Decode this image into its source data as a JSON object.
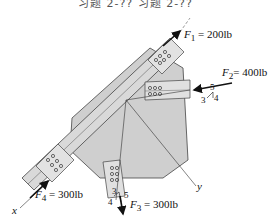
{
  "header": {
    "text": "习题 2-?? 习题 2-??"
  },
  "forces": [
    {
      "name": "F1",
      "symbol": "F",
      "sub": "1",
      "value": "= 200lb"
    },
    {
      "name": "F2",
      "symbol": "F",
      "sub": "2",
      "value": "=  400lb"
    },
    {
      "name": "F3",
      "symbol": "F",
      "sub": "3",
      "value": "= 300lb"
    },
    {
      "name": "F4",
      "symbol": "F",
      "sub": "4",
      "value": "= 300lb"
    }
  ],
  "slope_f2": {
    "hyp": "5",
    "a": "3",
    "b": "4"
  },
  "slope_f3": {
    "a": "3",
    "hyp": "5",
    "b": "4"
  },
  "axes": {
    "x": "x",
    "y": "y"
  },
  "colors": {
    "plate": "#cfcfcf",
    "member": "#d8d8d8",
    "stroke": "#333333"
  }
}
